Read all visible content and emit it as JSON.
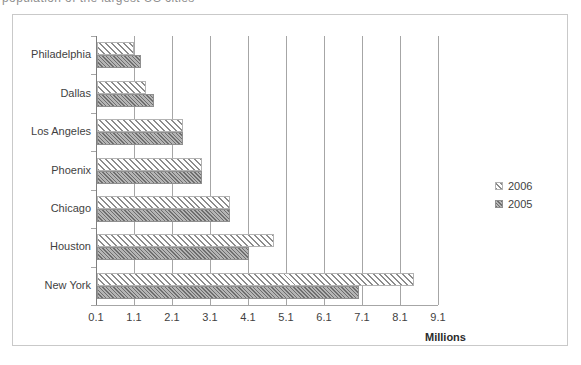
{
  "top_partial_text": "population of the largest US cities",
  "chart_data": {
    "type": "bar",
    "orientation": "horizontal",
    "title": "",
    "subtitle": "",
    "xlabel": "Millions",
    "ylabel": "",
    "categories": [
      "New York",
      "Houston",
      "Chicago",
      "Phoenix",
      "Los Angeles",
      "Dallas",
      "Philadelphia"
    ],
    "x_ticks": [
      "0.1",
      "1.1",
      "2.1",
      "3.1",
      "4.1",
      "5.1",
      "6.1",
      "7.1",
      "8.1",
      "9.1"
    ],
    "xlim": [
      0.1,
      9.1
    ],
    "grid": true,
    "legend_position": "right",
    "series": [
      {
        "name": "2006",
        "fill": "diagonal-hatch",
        "color": "#8c8c8c",
        "values": [
          8.45,
          4.75,
          3.6,
          2.85,
          2.35,
          1.4,
          1.08
        ]
      },
      {
        "name": "2005",
        "fill": "solid-gray",
        "color": "#9b9b9b",
        "values": [
          7.0,
          4.1,
          3.6,
          2.85,
          2.35,
          1.6,
          1.25
        ]
      }
    ]
  },
  "legend": {
    "items": [
      {
        "label": "2006",
        "swatch": "hatched-swatch-icon"
      },
      {
        "label": "2005",
        "swatch": "solid-swatch-icon"
      }
    ]
  },
  "colors": {
    "frame": "#c9c9c9",
    "gridline": "#a6a6a6",
    "axis": "#7f7f7f",
    "text": "#3f3f3f",
    "background": "#ffffff"
  }
}
